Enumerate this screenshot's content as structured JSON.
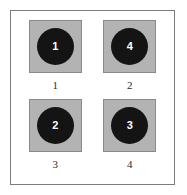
{
  "figure": {
    "panel_border_color": "#7c7c7c",
    "background_color": "#ffffff",
    "swatch_fill_color": "#b3b3b3",
    "swatch_border_color": "#8a8a8a",
    "disc_color": "#141414",
    "disc_label_color": "#ffffff",
    "caption_color": "#2b2b2b",
    "cells": [
      {
        "disc_value": "1",
        "caption": "1"
      },
      {
        "disc_value": "4",
        "caption": "2"
      },
      {
        "disc_value": "2",
        "caption": "3"
      },
      {
        "disc_value": "3",
        "caption": "4"
      }
    ]
  }
}
